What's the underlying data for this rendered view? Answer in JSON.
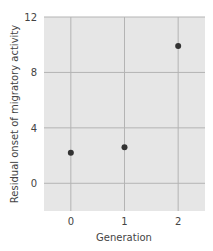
{
  "chart_data": {
    "type": "scatter",
    "title": "",
    "xlabel": "Generation",
    "ylabel": "Residual onset of migratory activity",
    "x": [
      0,
      1,
      2
    ],
    "values": [
      2.2,
      2.6,
      9.9
    ],
    "xticks": [
      "0",
      "1",
      "2"
    ],
    "yticks": [
      "0",
      "4",
      "8",
      "12"
    ],
    "xlim": [
      -0.5,
      2.5
    ],
    "ylim": [
      -2,
      12
    ],
    "grid": true,
    "legend": null,
    "colors": {
      "plot_background": "#e6e6e6",
      "grid": "#b4b4b4",
      "marker": "#333333"
    }
  }
}
